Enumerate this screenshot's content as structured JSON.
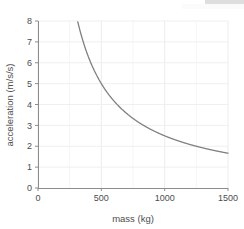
{
  "figure": {
    "name": "acceleration-vs-mass-plot",
    "background_color": "#ffffff",
    "curve_color": "#7f7f7f",
    "axis_color": "#808080",
    "grid_color": "#f2f2f2",
    "text_color": "#4d4d4d"
  },
  "chart_data": {
    "type": "line",
    "title": "",
    "xlabel": "mass (kg)",
    "ylabel": "acceleration (m/s/s)",
    "xlim": [
      0,
      1500
    ],
    "ylim": [
      0,
      8
    ],
    "xticks": [
      0,
      500,
      1000,
      1500
    ],
    "xtick_labels": [
      "0",
      "500",
      "1000",
      "1500"
    ],
    "yticks": [
      0,
      1,
      2,
      3,
      4,
      5,
      6,
      7,
      8
    ],
    "ytick_labels": [
      "0",
      "1",
      "2",
      "3",
      "4",
      "5",
      "6",
      "7",
      "8"
    ],
    "grid": true,
    "grid_minor_x_step": 250,
    "legend": null,
    "relation": "a = k / m",
    "k": 2500,
    "x": [
      270,
      300,
      350,
      400,
      450,
      500,
      550,
      600,
      650,
      700,
      750,
      800,
      850,
      900,
      950,
      1000,
      1050,
      1100,
      1150,
      1200,
      1250,
      1300,
      1350,
      1400,
      1450,
      1500
    ],
    "values": [
      9.26,
      8.33,
      7.14,
      6.25,
      5.56,
      5.0,
      4.55,
      4.17,
      3.85,
      3.57,
      3.33,
      3.12,
      2.94,
      2.78,
      2.63,
      2.5,
      2.38,
      2.27,
      2.17,
      2.08,
      2.0,
      1.92,
      1.85,
      1.79,
      1.72,
      1.67
    ],
    "visible_x_start": 312,
    "series": [
      {
        "name": "acceleration",
        "color": "#7f7f7f"
      }
    ]
  }
}
